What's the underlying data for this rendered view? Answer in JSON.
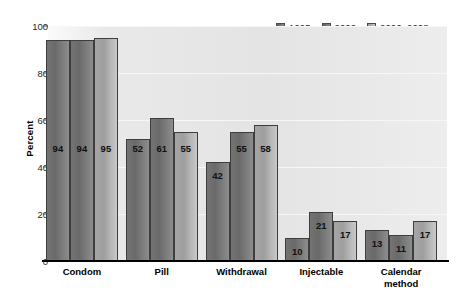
{
  "chart_data": {
    "type": "bar",
    "title": "",
    "xlabel": "",
    "ylabel": "Percent",
    "ylim": [
      0,
      100
    ],
    "yticks": [
      0,
      20,
      40,
      60,
      80,
      100
    ],
    "grid": true,
    "legend_position": "top-right",
    "categories": [
      "Condom",
      "Pill",
      "Withdrawal",
      "Injectable",
      "Calendar\nmethod"
    ],
    "series": [
      {
        "name": "1995",
        "color": "#6a6a6a",
        "values": [
          94,
          52,
          42,
          10,
          13
        ]
      },
      {
        "name": "2002",
        "color": "#6a6a6a",
        "values": [
          94,
          61,
          55,
          21,
          11
        ]
      },
      {
        "name": "2006–2008",
        "color": "#9e9e9e",
        "values": [
          95,
          55,
          58,
          17,
          17
        ]
      }
    ]
  },
  "axis": {
    "y_title": "Percent"
  }
}
